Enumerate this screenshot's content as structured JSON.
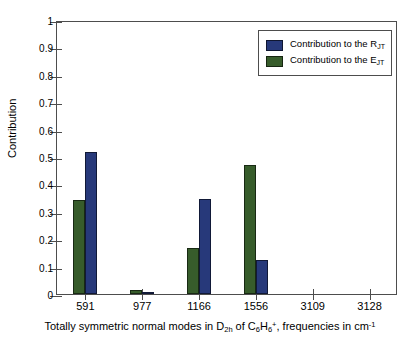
{
  "chart_data": {
    "type": "bar",
    "title": "",
    "xlabel": "Totally symmetric normal modes in D2h of C6H6+, frequencies in cm-1",
    "xlabel_parts": {
      "lead": "Totally symmetric normal modes in D",
      "sub1": "2h",
      "mid": " of C",
      "sub2": "6",
      "h": "H",
      "sub3": "6",
      "sup1": "+",
      "tail": ", frequencies in cm",
      "sup2": "-1"
    },
    "ylabel": "Contribution",
    "categories": [
      "591",
      "977",
      "1166",
      "1556",
      "3109",
      "3128"
    ],
    "series": [
      {
        "name": "Contribution to the R_JT",
        "label_lead": "Contribution to the R",
        "label_sub": "JT",
        "color": "#27397a",
        "values": [
          0.52,
          0.008,
          0.345,
          0.123,
          0.0,
          0.0
        ]
      },
      {
        "name": "Contribution to the E_JT",
        "label_lead": "Contribution to the E",
        "label_sub": "JT",
        "color": "#375c2b",
        "values": [
          0.343,
          0.016,
          0.168,
          0.47,
          0.0,
          0.0
        ]
      }
    ],
    "ylim": [
      0,
      1
    ],
    "yticks": [
      "0",
      "0.1",
      "0.2",
      "0.3",
      "0.4",
      "0.5",
      "0.6",
      "0.7",
      "0.8",
      "0.9",
      "1"
    ],
    "grid": false,
    "legend_position": "top-right",
    "series_order_in_legend": [
      "Contribution to the R_JT",
      "Contribution to the E_JT"
    ],
    "bar_order_in_group": [
      "Contribution to the E_JT",
      "Contribution to the R_JT"
    ]
  }
}
